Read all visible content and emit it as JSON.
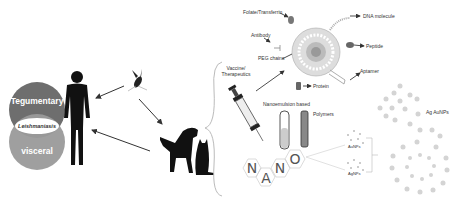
{
  "venn": {
    "top": "Tegumentary",
    "middle": "Leishmaniasis",
    "bottom": "visceral",
    "top_color": "#6e6e6e",
    "bottom_color": "#9a9a9a"
  },
  "hosts": [
    "human",
    "sandfly",
    "dog",
    "cat"
  ],
  "liposome_labels": {
    "folate": "Folate/Transferrin",
    "dna": "DNA molecule",
    "antibody": "Antibody",
    "peg": "PEG chains",
    "peptide": "Peptide",
    "aptamer": "Aptamer",
    "protein": "Protein"
  },
  "vaccine": {
    "line1": "Vaccine/",
    "line2": "Therapeutics"
  },
  "tubes": {
    "nanoemulsion": "Nanoemulsion based",
    "polymers": "Polymers"
  },
  "nano_letters": [
    "N",
    "A",
    "N",
    "O"
  ],
  "metal": {
    "aunp": "AuNPs",
    "agnp": "AgNPs",
    "agau": "Ag AuNPs"
  }
}
